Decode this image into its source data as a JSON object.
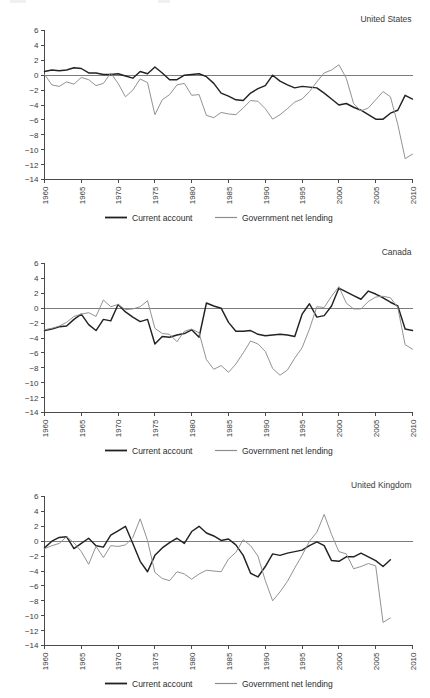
{
  "figure": {
    "legend": {
      "current_account_label": "Current account",
      "government_net_lending_label": "Government net lending"
    },
    "colors": {
      "current_account": "#222222",
      "government_net_lending": "#8c8c8c",
      "axis": "#4a4a4a",
      "zero_line": "#7d7d7d",
      "background": "#ffffff"
    },
    "y_ticks": [
      "6",
      "4",
      "2",
      "0",
      "-2",
      "-4",
      "-6",
      "-8",
      "-10",
      "-12",
      "-14"
    ],
    "x_ticks": [
      "1960",
      "1965",
      "1970",
      "1975",
      "1980",
      "1985",
      "1990",
      "1995",
      "2000",
      "2005",
      "2010"
    ],
    "panel_titles": [
      "United States",
      "Canada",
      "United Kingdom"
    ]
  },
  "chart_data": [
    {
      "type": "line",
      "title": "United States",
      "xlabel": "",
      "ylabel": "",
      "xlim": [
        1960,
        2010
      ],
      "ylim": [
        -14,
        6
      ],
      "ytick_step": 2,
      "xtick_step": 5,
      "grid": false,
      "legend_position": "bottom",
      "x": [
        1960,
        1961,
        1962,
        1963,
        1964,
        1965,
        1966,
        1967,
        1968,
        1969,
        1970,
        1971,
        1972,
        1973,
        1974,
        1975,
        1976,
        1977,
        1978,
        1979,
        1980,
        1981,
        1982,
        1983,
        1984,
        1985,
        1986,
        1987,
        1988,
        1989,
        1990,
        1991,
        1992,
        1993,
        1994,
        1995,
        1996,
        1997,
        1998,
        1999,
        2000,
        2001,
        2002,
        2003,
        2004,
        2005,
        2006,
        2007,
        2008,
        2009,
        2010
      ],
      "series": [
        {
          "name": "Current account",
          "values": [
            0.5,
            0.7,
            0.6,
            0.7,
            1.0,
            0.9,
            0.3,
            0.3,
            0.1,
            0.1,
            0.2,
            -0.1,
            -0.4,
            0.5,
            0.2,
            1.1,
            0.3,
            -0.6,
            -0.6,
            0.0,
            0.1,
            0.2,
            -0.2,
            -1.1,
            -2.4,
            -2.8,
            -3.3,
            -3.4,
            -2.4,
            -1.8,
            -1.4,
            0.0,
            -0.8,
            -1.3,
            -1.7,
            -1.5,
            -1.6,
            -1.7,
            -2.4,
            -3.2,
            -4.0,
            -3.8,
            -4.3,
            -4.7,
            -5.3,
            -5.9,
            -5.9,
            -5.1,
            -4.7,
            -2.7,
            -3.2
          ]
        },
        {
          "name": "Government net lending",
          "values": [
            0.1,
            -1.3,
            -1.5,
            -0.9,
            -1.2,
            -0.3,
            -0.6,
            -1.4,
            -1.1,
            0.3,
            -1.1,
            -2.9,
            -2.0,
            -0.5,
            -1.0,
            -5.3,
            -3.3,
            -2.6,
            -1.3,
            -1.1,
            -2.7,
            -2.6,
            -5.4,
            -5.7,
            -5.0,
            -5.2,
            -5.3,
            -4.4,
            -3.4,
            -3.5,
            -4.5,
            -5.9,
            -5.3,
            -4.5,
            -3.6,
            -3.2,
            -2.2,
            -0.9,
            0.3,
            0.7,
            1.4,
            -0.4,
            -3.8,
            -4.8,
            -4.4,
            -3.3,
            -2.2,
            -2.9,
            -6.6,
            -11.2,
            -10.6
          ]
        }
      ]
    },
    {
      "type": "line",
      "title": "Canada",
      "xlabel": "",
      "ylabel": "",
      "xlim": [
        1960,
        2010
      ],
      "ylim": [
        -14,
        6
      ],
      "ytick_step": 2,
      "xtick_step": 5,
      "grid": false,
      "legend_position": "bottom",
      "x": [
        1960,
        1961,
        1962,
        1963,
        1964,
        1965,
        1966,
        1967,
        1968,
        1969,
        1970,
        1971,
        1972,
        1973,
        1974,
        1975,
        1976,
        1977,
        1978,
        1979,
        1980,
        1981,
        1982,
        1983,
        1984,
        1985,
        1986,
        1987,
        1988,
        1989,
        1990,
        1991,
        1992,
        1993,
        1994,
        1995,
        1996,
        1997,
        1998,
        1999,
        2000,
        2001,
        2002,
        2003,
        2004,
        2005,
        2006,
        2007,
        2008,
        2009,
        2010
      ],
      "series": [
        {
          "name": "Current account",
          "values": [
            -3.0,
            -2.8,
            -2.5,
            -2.4,
            -1.5,
            -0.8,
            -2.2,
            -3.0,
            -1.5,
            -1.7,
            0.5,
            -0.5,
            -1.2,
            -1.8,
            -1.5,
            -4.8,
            -3.8,
            -3.9,
            -3.6,
            -3.4,
            -2.9,
            -3.9,
            0.7,
            0.3,
            0.0,
            -1.9,
            -3.1,
            -3.1,
            -3.0,
            -3.5,
            -3.7,
            -3.6,
            -3.5,
            -3.6,
            -3.8,
            -0.8,
            0.6,
            -1.2,
            -1.0,
            0.3,
            2.7,
            2.2,
            1.7,
            1.2,
            2.3,
            1.9,
            1.4,
            0.8,
            0.3,
            -2.8,
            -3.0
          ]
        },
        {
          "name": "Government net lending",
          "values": [
            -2.9,
            -2.7,
            -2.4,
            -1.9,
            -1.1,
            -0.8,
            -0.6,
            -1.1,
            1.1,
            0.2,
            0.5,
            -0.2,
            -0.1,
            0.2,
            1.0,
            -2.7,
            -3.4,
            -3.5,
            -4.5,
            -3.1,
            -2.8,
            -3.3,
            -6.9,
            -8.2,
            -7.7,
            -8.6,
            -7.5,
            -6.0,
            -4.4,
            -4.8,
            -5.8,
            -8.1,
            -9.0,
            -8.3,
            -6.7,
            -5.3,
            -2.8,
            0.2,
            0.1,
            1.6,
            2.9,
            0.7,
            -0.1,
            -0.1,
            0.9,
            1.5,
            1.6,
            1.4,
            0.1,
            -4.9,
            -5.5
          ]
        }
      ]
    },
    {
      "type": "line",
      "title": "United Kingdom",
      "xlabel": "",
      "ylabel": "",
      "xlim": [
        1960,
        2010
      ],
      "ylim": [
        -14,
        6
      ],
      "ytick_step": 2,
      "xtick_step": 5,
      "grid": false,
      "legend_position": "bottom",
      "x": [
        1960,
        1961,
        1962,
        1963,
        1964,
        1965,
        1966,
        1967,
        1968,
        1969,
        1970,
        1971,
        1972,
        1973,
        1974,
        1975,
        1976,
        1977,
        1978,
        1979,
        1980,
        1981,
        1982,
        1983,
        1984,
        1985,
        1986,
        1987,
        1988,
        1989,
        1990,
        1991,
        1992,
        1993,
        1994,
        1995,
        1996,
        1997,
        1998,
        1999,
        2000,
        2001,
        2002,
        2003,
        2004,
        2005,
        2006,
        2007
      ],
      "series": [
        {
          "name": "Current account",
          "values": [
            -0.9,
            0.0,
            0.5,
            0.6,
            -1.0,
            -0.3,
            0.4,
            -0.6,
            -0.8,
            0.8,
            1.4,
            2.0,
            -0.3,
            -2.7,
            -4.1,
            -1.9,
            -0.9,
            -0.2,
            0.4,
            -0.3,
            1.3,
            2.0,
            1.1,
            0.7,
            0.1,
            0.3,
            -0.5,
            -1.9,
            -4.3,
            -4.8,
            -3.4,
            -1.7,
            -1.9,
            -1.6,
            -1.4,
            -1.2,
            -0.6,
            -0.1,
            -0.6,
            -2.6,
            -2.7,
            -2.1,
            -2.1,
            -1.6,
            -2.1,
            -2.6,
            -3.4,
            -2.5
          ]
        },
        {
          "name": "Government net lending",
          "values": [
            -1.0,
            -0.6,
            -0.3,
            0.6,
            -0.2,
            -1.4,
            -3.1,
            -0.7,
            -2.2,
            -0.6,
            -0.7,
            -0.5,
            0.5,
            3.0,
            0.1,
            -4.2,
            -5.0,
            -5.3,
            -4.1,
            -4.4,
            -5.1,
            -4.4,
            -3.9,
            -4.0,
            -4.1,
            -2.4,
            -1.5,
            0.2,
            -0.6,
            -2.0,
            -5.3,
            -8.0,
            -6.8,
            -5.4,
            -3.6,
            -1.9,
            0.0,
            1.2,
            3.6,
            0.9,
            -1.4,
            -1.7,
            -3.7,
            -3.4,
            -3.0,
            -3.3,
            -10.9,
            -10.3
          ]
        }
      ]
    }
  ]
}
